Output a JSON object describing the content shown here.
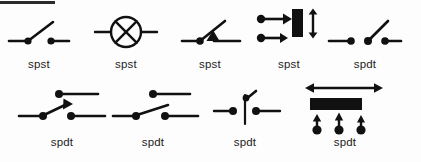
{
  "page": {
    "background_color": "#fdfdfd",
    "ink_color": "#111111",
    "title_bar_fragment": {
      "present": true,
      "color": "#2b2b2b",
      "x": 0,
      "y": 1,
      "width": 55,
      "height": 3
    }
  },
  "diagram": {
    "rows": [
      {
        "row_index": 1,
        "symbols": [
          {
            "id": "r1c1",
            "label": "spst",
            "icon": "knife-switch-open-icon",
            "x": 8,
            "y": 14,
            "w": 62,
            "h": 36,
            "label_x": 8,
            "label_y": 58,
            "label_w": 62
          },
          {
            "id": "r1c2",
            "label": "spst",
            "icon": "lamp-circle-cross-icon",
            "x": 94,
            "y": 12,
            "w": 64,
            "h": 40,
            "label_x": 94,
            "label_y": 58,
            "label_w": 64
          },
          {
            "id": "r1c3",
            "label": "spst",
            "icon": "switch-with-triangle-icon",
            "x": 181,
            "y": 14,
            "w": 60,
            "h": 36,
            "label_x": 180,
            "label_y": 58,
            "label_w": 60
          },
          {
            "id": "r1c4",
            "label": "spst",
            "icon": "slide-switch-vertical-icon",
            "x": 256,
            "y": 8,
            "w": 66,
            "h": 44,
            "label_x": 258,
            "label_y": 58,
            "label_w": 62
          },
          {
            "id": "r1c5",
            "label": "spdt",
            "icon": "changeover-switch-icon",
            "x": 328,
            "y": 14,
            "w": 74,
            "h": 36,
            "label_x": 334,
            "label_y": 58,
            "label_w": 62
          }
        ]
      },
      {
        "row_index": 2,
        "symbols": [
          {
            "id": "r2c1",
            "label": "spdt",
            "icon": "spdt-arrow-blade-icon",
            "x": 18,
            "y": 88,
            "w": 88,
            "h": 40,
            "label_x": 30,
            "label_y": 136,
            "label_w": 64
          },
          {
            "id": "r2c2",
            "label": "spdt",
            "icon": "spdt-plain-blade-icon",
            "x": 112,
            "y": 88,
            "w": 88,
            "h": 40,
            "label_x": 121,
            "label_y": 136,
            "label_w": 64
          },
          {
            "id": "r2c3",
            "label": "spdt",
            "icon": "spdt-vertical-stem-icon",
            "x": 212,
            "y": 90,
            "w": 70,
            "h": 40,
            "label_x": 213,
            "label_y": 136,
            "label_w": 64
          },
          {
            "id": "r2c4",
            "label": "spdt",
            "icon": "slide-switch-horizontal-icon",
            "x": 300,
            "y": 82,
            "w": 100,
            "h": 54,
            "label_x": 313,
            "label_y": 136,
            "label_w": 64
          }
        ]
      }
    ]
  }
}
